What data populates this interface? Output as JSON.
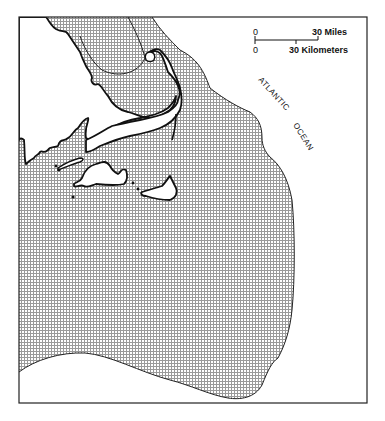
{
  "map": {
    "title": "",
    "colors": {
      "background": "#ffffff",
      "stroke": "#111111",
      "stipple": "#8a8a8a",
      "land": "#ffffff"
    },
    "scale_bar": {
      "miles_zero": "0",
      "miles_label": "30 Miles",
      "km_zero": "0",
      "km_label": "30 Kilometers"
    },
    "ocean_label": {
      "word1": "ATLANTIC",
      "word2": "OCEAN"
    },
    "legend": {
      "shaded_area": "stippled region (continental shelf zone)"
    },
    "features": [
      "mainland-coast",
      "cape-cod",
      "marthas-vineyard",
      "nantucket",
      "elizabeth-islands",
      "shelf-boundary"
    ]
  }
}
